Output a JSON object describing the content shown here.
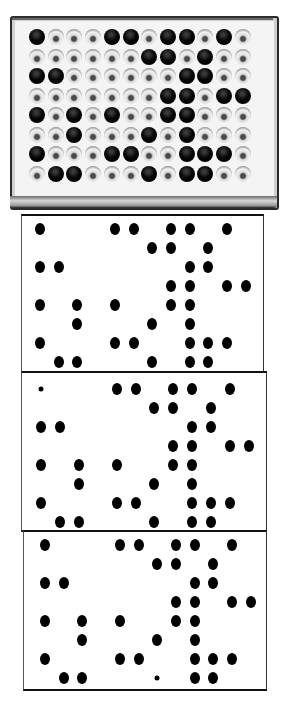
{
  "figure": {
    "plate": {
      "rows": 8,
      "cols": 12,
      "origin_x": 37,
      "origin_y": 37,
      "pitch_x": 18.7,
      "pitch_y": 19.5,
      "positive_wells": [
        [
          1,
          5,
          6,
          8,
          9,
          11
        ],
        [
          7,
          8,
          10
        ],
        [
          1,
          2,
          9,
          10
        ],
        [
          8,
          9,
          11,
          12
        ],
        [
          1,
          3,
          5,
          8,
          9
        ],
        [
          3,
          7,
          9
        ],
        [
          1,
          5,
          6,
          9,
          10,
          11
        ],
        [
          2,
          3,
          7,
          9,
          10
        ]
      ],
      "colors": {
        "positive": "#000000",
        "negative": "#e8e8e8",
        "frame": "#2a2a2a"
      }
    },
    "panels": [
      {
        "name": "dot-blot-1",
        "box": [
          21,
          214,
          241,
          157
        ],
        "origin_x": 40,
        "origin_y": 229,
        "pitch_x": 18.7,
        "pitch_y": 19,
        "dots": [
          [
            1,
            5,
            6,
            8,
            9,
            11
          ],
          [
            7,
            8,
            10
          ],
          [
            1,
            2,
            9,
            10
          ],
          [
            8,
            9,
            11,
            12
          ],
          [
            1,
            3,
            5,
            8,
            9
          ],
          [
            3,
            7,
            9
          ],
          [
            1,
            5,
            6,
            9,
            10,
            11
          ],
          [
            2,
            3,
            7,
            9,
            10
          ]
        ],
        "small_dots": []
      },
      {
        "name": "dot-blot-2",
        "box": [
          21,
          371,
          244,
          157
        ],
        "origin_x": 41,
        "origin_y": 389,
        "pitch_x": 18.9,
        "pitch_y": 19,
        "dots": [
          [
            1,
            5,
            6,
            8,
            9,
            11
          ],
          [
            7,
            8,
            10
          ],
          [
            1,
            2,
            9,
            10
          ],
          [
            8,
            9,
            11,
            12
          ],
          [
            1,
            3,
            5,
            8,
            9
          ],
          [
            3,
            7,
            9
          ],
          [
            1,
            5,
            6,
            9,
            10,
            11
          ],
          [
            2,
            3,
            7,
            9,
            10
          ]
        ],
        "small_dots": [
          [
            0,
            1
          ]
        ]
      },
      {
        "name": "dot-blot-3",
        "box": [
          23,
          530,
          242,
          157
        ],
        "origin_x": 45,
        "origin_y": 545,
        "pitch_x": 18.7,
        "pitch_y": 19,
        "dots": [
          [
            1,
            5,
            6,
            8,
            9,
            11
          ],
          [
            7,
            8,
            10
          ],
          [
            1,
            2,
            9,
            10
          ],
          [
            8,
            9,
            11,
            12
          ],
          [
            1,
            3,
            5,
            8,
            9
          ],
          [
            3,
            7,
            9
          ],
          [
            1,
            5,
            6,
            9,
            10,
            11
          ],
          [
            2,
            3,
            7,
            9,
            10
          ]
        ],
        "small_dots": [
          [
            7,
            7
          ]
        ]
      }
    ]
  }
}
